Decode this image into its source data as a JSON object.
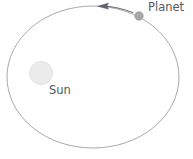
{
  "diagram": {
    "background_color": "#ffffff",
    "labels": {
      "planet": "Planet",
      "sun": "Sun"
    },
    "colors": {
      "orbit_stroke": "#9aa0a6",
      "label_text": "#55585c",
      "sun_fill": "#ebebeb",
      "sun_stroke": "#d8d8d8",
      "planet_fill": "#a8a8a8",
      "planet_stroke": "#8f8f8f",
      "arrow_stroke": "#5f6368"
    },
    "orbit": {
      "shape": "ellipse",
      "center_x": 93,
      "center_y": 77,
      "radius_x": 86,
      "radius_y": 71,
      "stroke_width": 0.9
    },
    "sun": {
      "center_x": 41,
      "center_y": 73,
      "radius": 11.5,
      "position_note": "offset left of orbit center at focus"
    },
    "planet": {
      "center_x": 139,
      "center_y": 16,
      "radius": 4.2,
      "position_note": "on orbit path, upper right"
    },
    "direction_arrow": {
      "points": "counter-clockwise",
      "head_x": 98,
      "head_y": 7,
      "tail_x": 133,
      "tail_y": 12
    }
  }
}
